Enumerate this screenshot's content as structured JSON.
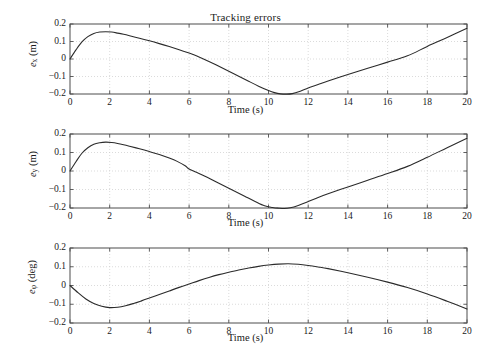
{
  "figure": {
    "title": "Tracking errors",
    "background": "#ffffff",
    "line_color": "#2b2b2b",
    "frame_color": "#4d4d4d",
    "grid_color": "#cccccc"
  },
  "chart_data": [
    {
      "type": "line",
      "title": "Tracking errors",
      "xlabel": "Time (s)",
      "ylabel": "e_x (m)",
      "ylabel_base": "e",
      "ylabel_sub": "x",
      "ylabel_unit": "(m)",
      "xlim": [
        0,
        20
      ],
      "ylim": [
        -0.2,
        0.2
      ],
      "xticks": [
        0,
        2,
        4,
        6,
        8,
        10,
        12,
        14,
        16,
        18,
        20
      ],
      "xticklabels": [
        "0",
        "2",
        "4",
        "6",
        "8",
        "10",
        "12",
        "14",
        "16",
        "18",
        "20"
      ],
      "yticks": [
        0.2,
        0.1,
        0,
        -0.1,
        -0.2
      ],
      "yticklabels": [
        "0.2",
        "0.1",
        "0",
        "−0.1",
        "−0.2"
      ],
      "grid": true,
      "legend": null,
      "x": [
        0,
        0.3,
        0.6,
        0.9,
        1.2,
        1.5,
        1.8,
        2.1,
        2.4,
        2.7,
        3.0,
        3.5,
        4.0,
        4.5,
        5.0,
        5.5,
        6.0,
        6.2,
        6.5,
        7.0,
        7.5,
        8.0,
        8.5,
        9.0,
        9.5,
        10.0,
        10.3,
        10.6,
        10.9,
        11.2,
        11.6,
        12.0,
        12.5,
        13.0,
        14.0,
        15.0,
        16.0,
        17.0,
        18.0,
        19.0,
        20.0
      ],
      "y": [
        0.0,
        0.052,
        0.098,
        0.128,
        0.146,
        0.154,
        0.156,
        0.154,
        0.148,
        0.141,
        0.133,
        0.119,
        0.104,
        0.088,
        0.071,
        0.053,
        0.034,
        0.026,
        0.012,
        -0.014,
        -0.042,
        -0.07,
        -0.098,
        -0.127,
        -0.155,
        -0.18,
        -0.192,
        -0.199,
        -0.201,
        -0.198,
        -0.184,
        -0.166,
        -0.146,
        -0.126,
        -0.089,
        -0.053,
        -0.018,
        0.018,
        0.072,
        0.123,
        0.176
      ]
    },
    {
      "type": "line",
      "title": null,
      "xlabel": "Time (s)",
      "ylabel": "e_y (m)",
      "ylabel_base": "e",
      "ylabel_sub": "y",
      "ylabel_unit": "(m)",
      "xlim": [
        0,
        20
      ],
      "ylim": [
        -0.2,
        0.2
      ],
      "xticks": [
        0,
        2,
        4,
        6,
        8,
        10,
        12,
        14,
        16,
        18,
        20
      ],
      "xticklabels": [
        "0",
        "2",
        "4",
        "6",
        "8",
        "10",
        "12",
        "14",
        "16",
        "18",
        "20"
      ],
      "yticks": [
        0.2,
        0.1,
        0,
        -0.1,
        -0.2
      ],
      "yticklabels": [
        "0.2",
        "0.1",
        "0",
        "−0.1",
        "−0.2"
      ],
      "grid": true,
      "legend": null,
      "x": [
        0,
        0.3,
        0.6,
        0.9,
        1.2,
        1.5,
        1.8,
        2.1,
        2.4,
        2.7,
        3.0,
        3.5,
        4.0,
        4.5,
        5.0,
        5.4,
        5.8,
        6.0,
        6.3,
        6.8,
        7.3,
        7.8,
        8.3,
        8.8,
        9.3,
        9.8,
        10.2,
        10.5,
        10.8,
        11.1,
        11.5,
        12.0,
        12.5,
        13.0,
        14.0,
        15.0,
        16.0,
        17.0,
        18.0,
        19.0,
        20.0
      ],
      "y": [
        0.0,
        0.05,
        0.096,
        0.126,
        0.145,
        0.153,
        0.156,
        0.154,
        0.149,
        0.142,
        0.134,
        0.12,
        0.105,
        0.089,
        0.07,
        0.052,
        0.028,
        0.011,
        -0.004,
        -0.028,
        -0.055,
        -0.082,
        -0.109,
        -0.136,
        -0.163,
        -0.188,
        -0.197,
        -0.201,
        -0.203,
        -0.199,
        -0.186,
        -0.165,
        -0.143,
        -0.123,
        -0.086,
        -0.05,
        -0.014,
        0.025,
        0.074,
        0.126,
        0.177
      ]
    },
    {
      "type": "line",
      "title": null,
      "xlabel": "Time (s)",
      "ylabel": "e_phi (deg)",
      "ylabel_base": "e",
      "ylabel_sub": "φ",
      "ylabel_unit": "(deg)",
      "xlim": [
        0,
        20
      ],
      "ylim": [
        -0.2,
        0.2
      ],
      "xticks": [
        0,
        2,
        4,
        6,
        8,
        10,
        12,
        14,
        16,
        18,
        20
      ],
      "xticklabels": [
        "0",
        "2",
        "4",
        "6",
        "8",
        "10",
        "12",
        "14",
        "16",
        "18",
        "20"
      ],
      "yticks": [
        0.2,
        0.1,
        0,
        -0.1,
        -0.2
      ],
      "yticklabels": [
        "0.2",
        "0.1",
        "0",
        "−0.1",
        "−0.2"
      ],
      "grid": true,
      "legend": null,
      "x": [
        0,
        0.4,
        0.8,
        1.2,
        1.6,
        2.0,
        2.4,
        2.8,
        3.2,
        3.6,
        4.0,
        4.5,
        5.0,
        5.5,
        6.0,
        6.5,
        7.0,
        7.5,
        8.0,
        8.5,
        9.0,
        9.5,
        10.0,
        10.5,
        11.0,
        11.5,
        12.0,
        12.5,
        13.0,
        14.0,
        15.0,
        16.0,
        17.0,
        18.0,
        19.0,
        20.0
      ],
      "y": [
        0.0,
        -0.038,
        -0.072,
        -0.096,
        -0.111,
        -0.118,
        -0.116,
        -0.108,
        -0.096,
        -0.082,
        -0.067,
        -0.048,
        -0.029,
        -0.01,
        0.008,
        0.026,
        0.043,
        0.058,
        0.071,
        0.083,
        0.093,
        0.102,
        0.109,
        0.114,
        0.116,
        0.113,
        0.107,
        0.099,
        0.09,
        0.068,
        0.044,
        0.018,
        -0.011,
        -0.045,
        -0.084,
        -0.125
      ]
    }
  ],
  "panels": [
    {
      "index": 0,
      "name": "error-x-panel"
    },
    {
      "index": 1,
      "name": "error-y-panel"
    },
    {
      "index": 2,
      "name": "error-phi-panel"
    }
  ]
}
